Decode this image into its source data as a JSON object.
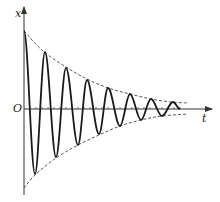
{
  "diagram": {
    "type": "damped-oscillation",
    "labels": {
      "y_axis": "x",
      "x_axis": "t",
      "origin": "O"
    },
    "colors": {
      "curve": "#1a1a1a",
      "axis": "#333333",
      "envelope": "#444444",
      "background": "#ffffff"
    },
    "axes": {
      "origin": [
        24,
        109
      ],
      "y_top": 7,
      "x_right": 212
    },
    "ticks_x": [
      30,
      36,
      42,
      48,
      54,
      60,
      66,
      72,
      78,
      84,
      90,
      96,
      102,
      108,
      114,
      120,
      126,
      132,
      138,
      144,
      150,
      156,
      162,
      168,
      174,
      180
    ],
    "envelope_upper": [
      [
        24,
        31
      ],
      [
        43,
        51
      ],
      [
        66,
        67
      ],
      [
        87,
        79
      ],
      [
        108,
        88
      ],
      [
        130,
        94
      ],
      [
        151,
        99
      ],
      [
        171,
        102
      ],
      [
        188,
        103
      ]
    ],
    "envelope_lower": [
      [
        24,
        188
      ],
      [
        35,
        175
      ],
      [
        56,
        158
      ],
      [
        78,
        145
      ],
      [
        99,
        135
      ],
      [
        120,
        126
      ],
      [
        141,
        120
      ],
      [
        162,
        116
      ],
      [
        188,
        114
      ]
    ],
    "curve_points": [
      [
        24,
        31
      ],
      [
        35,
        174
      ],
      [
        45,
        52
      ],
      [
        56,
        157
      ],
      [
        66,
        68
      ],
      [
        78,
        145
      ],
      [
        87,
        80
      ],
      [
        99,
        134
      ],
      [
        108,
        88
      ],
      [
        120,
        126
      ],
      [
        130,
        94
      ],
      [
        141,
        120
      ],
      [
        151,
        99
      ],
      [
        162,
        116
      ],
      [
        173,
        102
      ],
      [
        180,
        109
      ]
    ]
  }
}
